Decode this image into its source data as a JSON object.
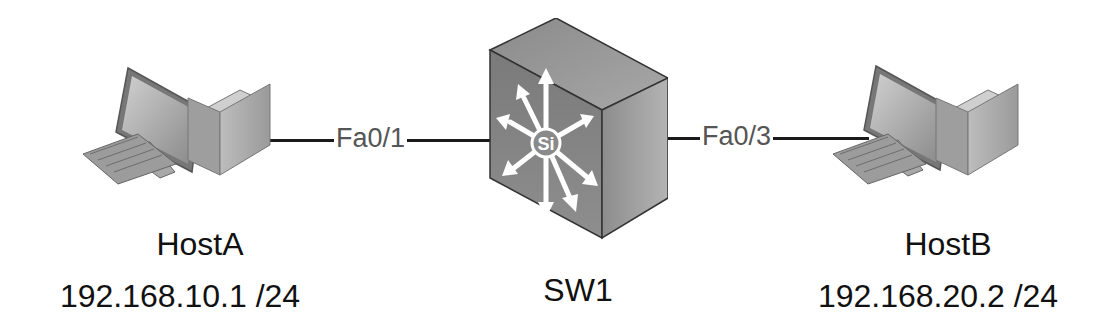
{
  "diagram": {
    "type": "network-topology",
    "nodes": [
      {
        "id": "hostA",
        "name": "HostA",
        "ip": "192.168.10.1 /24",
        "icon": "pc-icon"
      },
      {
        "id": "sw1",
        "name": "SW1",
        "icon": "multilayer-switch-icon",
        "badge": "Si"
      },
      {
        "id": "hostB",
        "name": "HostB",
        "ip": "192.168.20.2 /24",
        "icon": "pc-icon"
      }
    ],
    "links": [
      {
        "from": "hostA",
        "to": "sw1",
        "label": "Fa0/1"
      },
      {
        "from": "sw1",
        "to": "hostB",
        "label": "Fa0/3"
      }
    ]
  }
}
